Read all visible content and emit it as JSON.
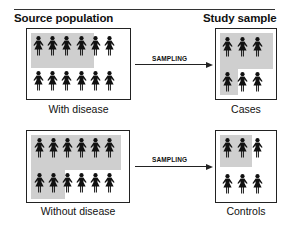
{
  "headings": {
    "left": "Source population",
    "right": "Study sample"
  },
  "rows": [
    {
      "source_caption": "With disease",
      "sample_caption": "Cases",
      "arrow_label": "SAMPLING",
      "source_figures": {
        "rows": 2,
        "cols": 6,
        "shaded": [
          [
            1,
            1,
            1,
            1,
            0,
            0
          ],
          [
            0,
            0,
            0,
            0,
            0,
            0
          ]
        ]
      },
      "sample_figures": {
        "rows": 2,
        "cols": 3,
        "shaded": [
          [
            1,
            1,
            1
          ],
          [
            1,
            0,
            0
          ]
        ]
      }
    },
    {
      "source_caption": "Without disease",
      "sample_caption": "Controls",
      "arrow_label": "SAMPLING",
      "source_figures": {
        "rows": 2,
        "cols": 6,
        "shaded": [
          [
            1,
            1,
            1,
            1,
            1,
            1
          ],
          [
            1,
            1,
            0,
            0,
            0,
            0
          ]
        ]
      },
      "sample_figures": {
        "rows": 2,
        "cols": 3,
        "shaded": [
          [
            1,
            1,
            0
          ],
          [
            0,
            0,
            0
          ]
        ]
      }
    }
  ],
  "colors": {
    "shade": "#cfcfcf",
    "figure": "#111111",
    "line": "#222222"
  },
  "icons": {
    "figure": "female-person-icon",
    "arrow": "right-arrow-icon"
  }
}
